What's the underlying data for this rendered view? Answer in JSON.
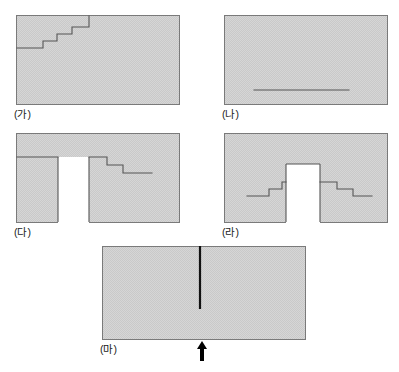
{
  "figure": {
    "title": "",
    "background_color": "#ffffff",
    "panel_fill_color": "#d2d2d2",
    "panel_stroke_color": "#7a7a7a",
    "line_color": "#4a4a4a",
    "marker_color": "#000000",
    "panel_count": 5
  },
  "panels": [
    {
      "id": "ga",
      "label": "(가)",
      "x": 16,
      "y": 15,
      "width": 164,
      "height": 90,
      "description": "rectangle with ascending staircase line in upper-left",
      "feature": "ascending-staircase",
      "steps": 4,
      "white_block": false
    },
    {
      "id": "na",
      "label": "(나)",
      "x": 224,
      "y": 15,
      "width": 164,
      "height": 90,
      "description": "rectangle with a single horizontal line in lower area",
      "feature": "horizontal-line",
      "steps": 0,
      "white_block": false
    },
    {
      "id": "da",
      "label": "(다)",
      "x": 16,
      "y": 133,
      "width": 164,
      "height": 90,
      "description": "rectangle with white vertical block and descending staircase to the right",
      "feature": "white-block-with-descending-steps",
      "steps": 3,
      "white_block": true
    },
    {
      "id": "ra",
      "label": "(라)",
      "x": 224,
      "y": 133,
      "width": 164,
      "height": 90,
      "description": "rectangle with white vertical block in center, ascending steps left and descending steps right",
      "feature": "white-block-with-steps-both-sides",
      "steps": 6,
      "white_block": true
    },
    {
      "id": "ma",
      "label": "(마)",
      "x": 102,
      "y": 246,
      "width": 204,
      "height": 94,
      "description": "rectangle with vertical black line from top edge downward and an upward arrow marker below the bottom edge",
      "feature": "vertical-line-with-arrow",
      "steps": 0,
      "white_block": false
    }
  ],
  "labels": {
    "ga": "(가)",
    "na": "(나)",
    "da": "(다)",
    "ra": "(라)",
    "ma": "(마)"
  },
  "markers": {
    "arrow": {
      "name": "up-arrow",
      "glyph": "↑",
      "panel": "ma",
      "position": "below-bottom-edge-center"
    }
  }
}
